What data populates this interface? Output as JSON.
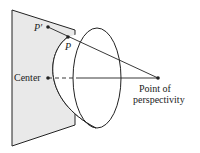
{
  "diagram": {
    "labels": {
      "p_prime": "P′",
      "p": "P",
      "center": "Center",
      "perspectivity_line1": "Point of",
      "perspectivity_line2": "perspectivity"
    },
    "colors": {
      "plane_fill": "#e9e9e9",
      "stroke": "#222222",
      "background": "#ffffff"
    }
  }
}
